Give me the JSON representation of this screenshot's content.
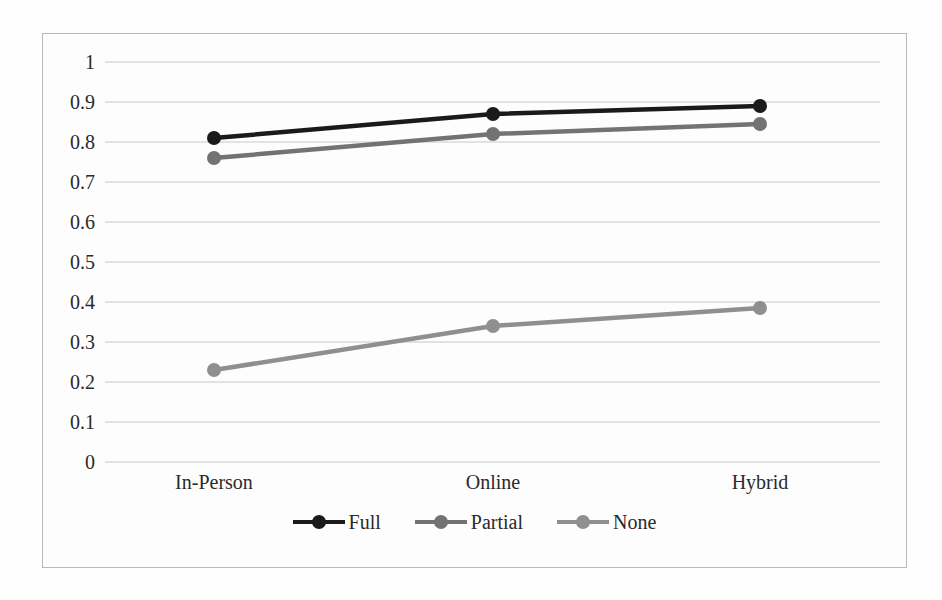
{
  "chart_data": {
    "type": "line",
    "title": "",
    "xlabel": "",
    "ylabel": "",
    "categories": [
      "In-Person",
      "Online",
      "Hybrid"
    ],
    "ylim": [
      0,
      1
    ],
    "ytick_labels": [
      "1",
      "0.9",
      "0.8",
      "0.7",
      "0.6",
      "0.5",
      "0.4",
      "0.3",
      "0.2",
      "0.1",
      "0"
    ],
    "ytick_values": [
      1,
      0.9,
      0.8,
      0.7,
      0.6,
      0.5,
      0.4,
      0.3,
      0.2,
      0.1,
      0
    ],
    "grid": "horizontal",
    "legend_position": "bottom",
    "series": [
      {
        "name": "Full",
        "values": [
          0.81,
          0.87,
          0.89
        ],
        "color": "#1a1a1a",
        "marker": "circle"
      },
      {
        "name": "Partial",
        "values": [
          0.76,
          0.82,
          0.845
        ],
        "color": "#737373",
        "marker": "circle"
      },
      {
        "name": "None",
        "values": [
          0.23,
          0.34,
          0.385
        ],
        "color": "#8f8f8f",
        "marker": "circle"
      }
    ]
  },
  "legend": {
    "items": [
      {
        "label": "Full",
        "color": "#1a1a1a"
      },
      {
        "label": "Partial",
        "color": "#737373"
      },
      {
        "label": "None",
        "color": "#8f8f8f"
      }
    ]
  },
  "axis": {
    "y_labels": [
      "1",
      "0.9",
      "0.8",
      "0.7",
      "0.6",
      "0.5",
      "0.4",
      "0.3",
      "0.2",
      "0.1",
      "0"
    ],
    "x_labels": [
      "In-Person",
      "Online",
      "Hybrid"
    ]
  },
  "style": {
    "grid_color": "#c8c8c8",
    "frame_color": "#b9b9b9",
    "background": "#fdfdfd",
    "text_color": "#2a2a2a"
  }
}
